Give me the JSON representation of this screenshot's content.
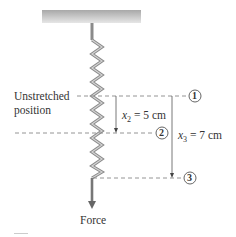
{
  "diagram": {
    "labels": {
      "unstretched_line1": "Unstretched",
      "unstretched_line2": "position",
      "x2_var": "x",
      "x2_sub": "2",
      "x2_value": " = 5 cm",
      "x3_var": "x",
      "x3_sub": "3",
      "x3_value": " = 7 cm",
      "force": "Force"
    },
    "markers": [
      {
        "id": "1",
        "label": "1"
      },
      {
        "id": "2",
        "label": "2"
      },
      {
        "id": "3",
        "label": "3"
      }
    ],
    "colors": {
      "spring": "#8a8a8a",
      "spring_highlight": "#d0d0d0",
      "ceiling_top": "#9a9a9a",
      "ceiling_bottom": "#e4e4e4",
      "dashes": "#888888",
      "arrows": "#555555",
      "text": "#333333"
    }
  }
}
